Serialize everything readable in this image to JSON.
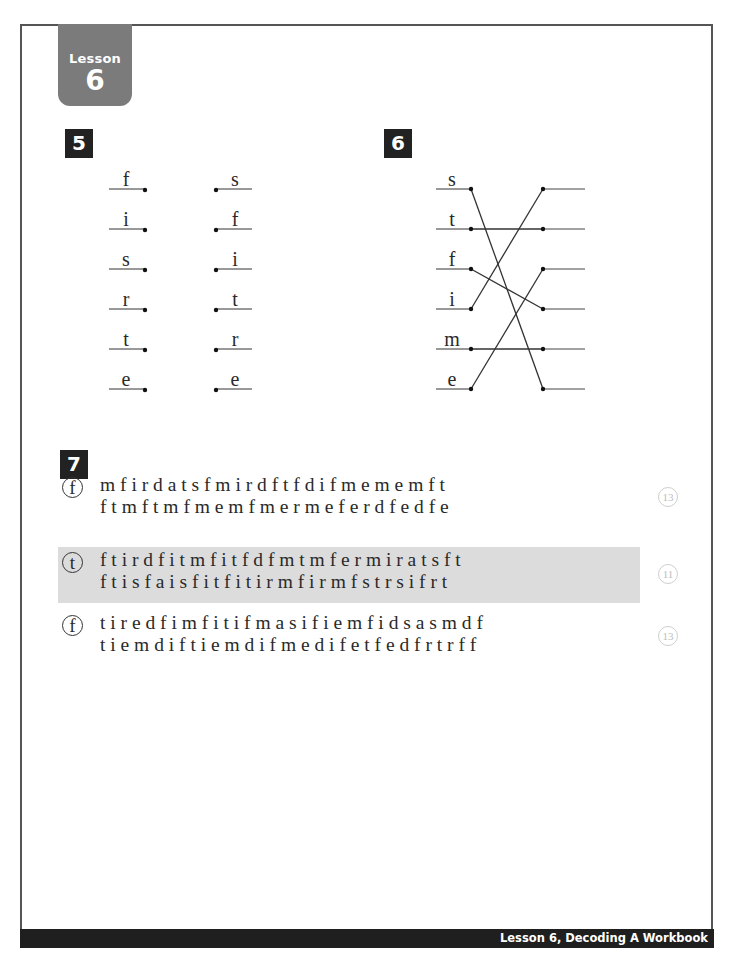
{
  "lesson_tab": {
    "label": "Lesson",
    "number": "6"
  },
  "exercise5": {
    "number": "5",
    "left_letters": [
      "f",
      "i",
      "s",
      "r",
      "t",
      "e"
    ],
    "right_letters": [
      "s",
      "f",
      "i",
      "t",
      "r",
      "e"
    ]
  },
  "exercise6": {
    "number": "6",
    "left_letters": [
      "s",
      "t",
      "f",
      "i",
      "m",
      "e"
    ],
    "connections": [
      {
        "from": 0,
        "to": 5
      },
      {
        "from": 1,
        "to": 1
      },
      {
        "from": 2,
        "to": 3
      },
      {
        "from": 3,
        "to": 0
      },
      {
        "from": 4,
        "to": 4
      },
      {
        "from": 5,
        "to": 2
      }
    ]
  },
  "exercise7": {
    "number": "7",
    "rows": [
      {
        "target": "f",
        "highlighted": false,
        "line1": "m f i r d a t s f m i r d f t f d i f m e m e m f t",
        "line2": "f t m f t m f m e m f m e r m e f e r d f e d f e",
        "count": "13"
      },
      {
        "target": "t",
        "highlighted": true,
        "line1": "f t i r d f i t m f i t f d f m t m f e r m i r a t s f t",
        "line2": "f t i s f a i s f i t f i t i r m f i r m f s t r s i f r t",
        "count": "11"
      },
      {
        "target": "f",
        "highlighted": false,
        "line1": "t i r e d f i m f i t i f m a s i f i e m f i d s a s m d f",
        "line2": "t i e m d i f t i e m d i f m e d i f e t f e d f r t r f f",
        "count": "13"
      }
    ]
  },
  "footer": {
    "text": "Lesson 6, Decoding A Workbook"
  },
  "colors": {
    "tab": "#7b7b7b",
    "highlight": "#dcdcdc",
    "footer": "#1f1f1f"
  }
}
